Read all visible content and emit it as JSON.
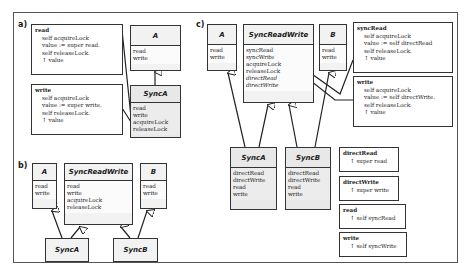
{
  "panels": {
    "a": {
      "label": "a)",
      "code_read": {
        "name": "read",
        "lines": [
          "self acquireLock",
          "value := super read.",
          "self releaseLock.",
          "↑ value"
        ]
      },
      "code_write": {
        "name": "write",
        "lines": [
          "self acquireLock",
          "value := super write.",
          "self releaseLock.",
          "↑ value"
        ]
      },
      "class_A": {
        "name": "A",
        "methods": [
          "read",
          "write"
        ]
      },
      "class_SyncA": {
        "name": "SyncA",
        "methods": [
          "read",
          "write",
          "acquireLock",
          "releaseLock"
        ]
      }
    },
    "b": {
      "label": "b)",
      "class_A": {
        "name": "A",
        "methods": [
          "read",
          "write"
        ]
      },
      "class_SyncReadWrite": {
        "name": "SyncReadWrite",
        "methods": [
          "read",
          "write",
          "acquireLock",
          "releaseLock"
        ]
      },
      "class_B": {
        "name": "B",
        "methods": [
          "read",
          "write"
        ]
      },
      "class_SyncA": {
        "name": "SyncA"
      },
      "class_SyncB": {
        "name": "SyncB"
      }
    },
    "c": {
      "label": "c)",
      "class_A": {
        "name": "A",
        "methods": [
          "read",
          "write"
        ]
      },
      "class_SyncReadWrite": {
        "name": "SyncReadWrite",
        "methods": [
          "syncRead",
          "syncWrite",
          "acquireLock",
          "releaseLock",
          "directRead",
          "directWrite"
        ]
      },
      "class_B": {
        "name": "B",
        "methods": [
          "read",
          "write"
        ]
      },
      "class_SyncA": {
        "name": "SyncA",
        "methods": [
          "directRead",
          "directWrite",
          "read",
          "write"
        ]
      },
      "class_SyncB": {
        "name": "SyncB",
        "methods": [
          "directRead",
          "directWrite",
          "read",
          "write"
        ]
      },
      "code_syncRead": {
        "name": "syncRead",
        "lines": [
          "self acquireLock",
          "value := self directRead",
          "self releaseLock.",
          "↑ value"
        ]
      },
      "code_write": {
        "name": "write",
        "lines": [
          "self acquireLock",
          "value := self directWrite.",
          "self releaseLock.",
          "↑ value"
        ]
      },
      "code_directRead": {
        "name": "directRead",
        "lines": [
          "↑ super read"
        ]
      },
      "code_directWrite": {
        "name": "directWrite",
        "lines": [
          "↑ super write"
        ]
      },
      "code_read": {
        "name": "read",
        "lines": [
          "↑ self syncRead"
        ]
      },
      "code_write2": {
        "name": "write",
        "lines": [
          "↑ self syncWrite"
        ]
      }
    }
  }
}
